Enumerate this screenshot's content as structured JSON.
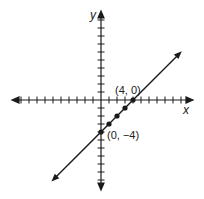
{
  "chart_data": {
    "type": "line",
    "title": "",
    "xlabel": "x",
    "ylabel": "y",
    "xlim": [
      -11,
      11
    ],
    "ylim": [
      -11,
      11
    ],
    "grid": false,
    "tick_spacing": 1,
    "line": {
      "slope": 1,
      "intercept": -4,
      "equation": "y = x - 4"
    },
    "points": [
      {
        "x": 0,
        "y": -4
      },
      {
        "x": 1,
        "y": -3
      },
      {
        "x": 2,
        "y": -2
      },
      {
        "x": 3,
        "y": -1
      },
      {
        "x": 4,
        "y": 0
      }
    ],
    "annotations": [
      {
        "text": "(4, 0)",
        "x": 4,
        "y": 0
      },
      {
        "text": "(0, −4)",
        "x": 0,
        "y": -4
      }
    ]
  },
  "labels": {
    "x_axis": "x",
    "y_axis": "y",
    "x_intercept": "(4, 0)",
    "y_intercept": "(0, −4)"
  },
  "colors": {
    "stroke": "#1a1a1a",
    "background": "#ffffff"
  }
}
